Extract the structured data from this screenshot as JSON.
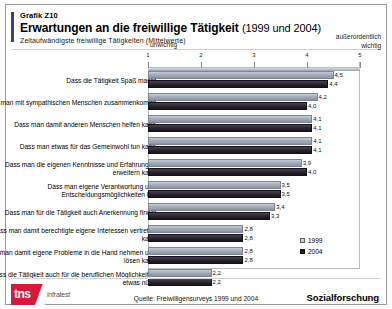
{
  "header": {
    "kicker": "Grafik Z10",
    "title": "Erwartungen an die freiwillige Tätigkeit",
    "title_years": "(1999 und 2004)",
    "subtitle": "Zeitaufwändigste freiwillige Tätigkeiten (Mittelwerte)"
  },
  "footer": {
    "logo_mark": "tns",
    "logo_word": "infratest",
    "source": "Quelle: Freiwilligensurveys 1999 und 2004",
    "brand": "Sozialforschung"
  },
  "chart_data": {
    "type": "bar",
    "orientation": "horizontal",
    "title": "Erwartungen an die freiwillige Tätigkeit (1999 und 2004)",
    "subtitle": "Zeitaufwändigste freiwillige Tätigkeiten (Mittelwerte)",
    "xlabel": "",
    "ylabel": "",
    "xlim": [
      1,
      5
    ],
    "ticks": [
      1,
      2,
      3,
      4,
      5
    ],
    "ticklabels": [
      "1",
      "2",
      "3",
      "4",
      "5"
    ],
    "axis_low_label": "unwichtig",
    "axis_high_label": "außerordentlich\nwichtig",
    "axis_high_label_line1": "außerordentlich",
    "axis_high_label_line2": "wichtig",
    "grid": false,
    "legend_position": "bottom-right",
    "categories": [
      "Dass die Tätigkeit Spaß macht",
      "Dass  man mit sympathischen Menschen zusammenkommt",
      "Dass man damit anderen Menschen helfen kann",
      "Dass man etwas für das Gemeinwohl tun kann",
      "Dass man die eigenen Kenntnisse und Erfahrungen erweitern kann",
      "Dass man eigene Verantwortung und Entscheidungsmöglichkeiten hat",
      "Dass man für die Tätigkeit auch Anerkennung findet",
      "Dass man damit berechtigte eigene Interessen vertreten kann",
      "Dass man damit eigene Probleme in die Hand nehmen und lösen kann",
      "Dass die Tätigkeit auch für die beruflichen Möglichkeiten etwas nützt"
    ],
    "series": [
      {
        "name": "1999",
        "color": "#a6acba",
        "values": [
          4.5,
          4.2,
          4.1,
          4.1,
          3.9,
          3.5,
          3.4,
          2.8,
          2.8,
          2.2
        ],
        "labels": [
          "4,5",
          "4,2",
          "4,1",
          "4,1",
          "3,9",
          "3,5",
          "3,4",
          "2,8",
          "2,8",
          "2,2"
        ]
      },
      {
        "name": "2004",
        "color": "#231e28",
        "values": [
          4.4,
          4.0,
          4.1,
          4.1,
          4.0,
          3.5,
          3.3,
          2.8,
          2.8,
          2.2
        ],
        "labels": [
          "4,4",
          "4,0",
          "4,1",
          "4,1",
          "4,0",
          "3,5",
          "3,3",
          "2,8",
          "2,8",
          "2,2"
        ]
      }
    ],
    "legend": [
      "1999",
      "2004"
    ]
  }
}
